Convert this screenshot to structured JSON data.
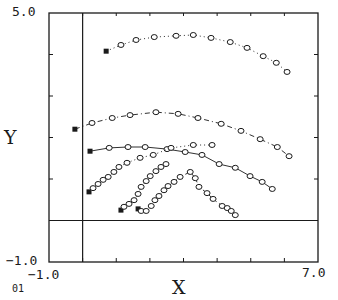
{
  "chart_data": {
    "type": "scatter",
    "title": "",
    "xlabel": "X",
    "ylabel": "Y",
    "xlim": [
      -1.0,
      7.0
    ],
    "ylim": [
      -1.0,
      5.0
    ],
    "x_tick_labels": [
      "-1.0",
      "7.0"
    ],
    "y_tick_labels": [
      "-1.0",
      "5.0"
    ],
    "x_ticks": [
      -1,
      0,
      1,
      2,
      3,
      4,
      5,
      6,
      7
    ],
    "y_ticks": [
      -1,
      0,
      1,
      2,
      3,
      4,
      5
    ],
    "reference_lines": {
      "x": 0.0,
      "y": 0.0
    },
    "grid": false,
    "legend": null,
    "corner_label": "01",
    "series": [
      {
        "name": "trajectory-1",
        "line_style": "dotted",
        "start_marker": "filled-square",
        "marker": "open-circle",
        "points": [
          [
            0.7,
            4.08
          ],
          [
            1.14,
            4.23
          ],
          [
            1.59,
            4.35
          ],
          [
            2.13,
            4.42
          ],
          [
            2.78,
            4.45
          ],
          [
            3.29,
            4.47
          ],
          [
            3.82,
            4.4
          ],
          [
            4.39,
            4.3
          ],
          [
            4.89,
            4.16
          ],
          [
            5.37,
            3.96
          ],
          [
            5.76,
            3.8
          ],
          [
            6.08,
            3.58
          ]
        ]
      },
      {
        "name": "trajectory-2",
        "line_style": "dashdot",
        "start_marker": "filled-square",
        "marker": "open-circle",
        "points": [
          [
            -0.23,
            2.2
          ],
          [
            0.28,
            2.35
          ],
          [
            0.88,
            2.47
          ],
          [
            1.41,
            2.54
          ],
          [
            2.18,
            2.61
          ],
          [
            2.84,
            2.57
          ],
          [
            3.43,
            2.47
          ],
          [
            4.12,
            2.33
          ],
          [
            4.71,
            2.16
          ],
          [
            5.28,
            1.96
          ],
          [
            5.79,
            1.77
          ],
          [
            6.14,
            1.55
          ]
        ]
      },
      {
        "name": "trajectory-3",
        "line_style": "solid",
        "start_marker": "filled-square",
        "marker": "open-circle",
        "points": [
          [
            0.22,
            1.67
          ],
          [
            0.79,
            1.75
          ],
          [
            1.35,
            1.77
          ],
          [
            1.86,
            1.77
          ],
          [
            2.51,
            1.72
          ],
          [
            3.05,
            1.65
          ],
          [
            3.55,
            1.58
          ],
          [
            4.06,
            1.36
          ],
          [
            4.54,
            1.27
          ],
          [
            4.98,
            1.07
          ],
          [
            5.34,
            0.93
          ],
          [
            5.64,
            0.76
          ]
        ]
      },
      {
        "name": "trajectory-4",
        "line_style": "dotted",
        "start_marker": "filled-square",
        "marker": "open-circle",
        "points": [
          [
            0.19,
            0.69
          ],
          [
            0.31,
            0.78
          ],
          [
            0.46,
            0.88
          ],
          [
            0.61,
            0.98
          ],
          [
            0.76,
            1.05
          ],
          [
            0.93,
            1.17
          ],
          [
            1.08,
            1.29
          ],
          [
            1.32,
            1.39
          ],
          [
            1.71,
            1.51
          ],
          [
            2.1,
            1.58
          ],
          [
            2.63,
            1.75
          ],
          [
            3.29,
            1.82
          ],
          [
            3.85,
            1.82
          ]
        ]
      },
      {
        "name": "trajectory-5",
        "line_style": "dotted",
        "start_marker": "filled-square",
        "marker": "open-circle",
        "points": [
          [
            1.14,
            0.25
          ],
          [
            1.23,
            0.33
          ],
          [
            1.38,
            0.4
          ],
          [
            1.53,
            0.49
          ],
          [
            1.65,
            0.64
          ],
          [
            1.74,
            0.81
          ],
          [
            1.89,
            0.95
          ],
          [
            2.01,
            1.07
          ],
          [
            2.18,
            1.19
          ],
          [
            2.33,
            1.29
          ],
          [
            2.48,
            1.36
          ]
        ]
      },
      {
        "name": "trajectory-6",
        "line_style": "dashed",
        "start_marker": "filled-square",
        "marker": "open-circle",
        "points": [
          [
            1.65,
            0.28
          ],
          [
            1.74,
            0.23
          ],
          [
            1.89,
            0.23
          ],
          [
            2.04,
            0.35
          ],
          [
            2.15,
            0.49
          ],
          [
            2.27,
            0.59
          ],
          [
            2.42,
            0.73
          ],
          [
            2.54,
            0.83
          ],
          [
            2.72,
            0.93
          ],
          [
            2.9,
            1.05
          ],
          [
            3.2,
            1.17
          ],
          [
            3.35,
            1.02
          ],
          [
            3.46,
            0.81
          ],
          [
            3.7,
            0.66
          ],
          [
            3.88,
            0.52
          ],
          [
            4.15,
            0.35
          ],
          [
            4.3,
            0.3
          ],
          [
            4.42,
            0.23
          ],
          [
            4.54,
            0.13
          ]
        ]
      }
    ]
  },
  "labels": {
    "y_top": "5.0",
    "y_bottom": "−1.0",
    "x_left": "−1.0",
    "x_right": "7.0",
    "x_title": "X",
    "y_title": "Y",
    "corner": "01"
  },
  "style": {
    "ink": "#1a1a1a",
    "background": "#ffffff"
  }
}
